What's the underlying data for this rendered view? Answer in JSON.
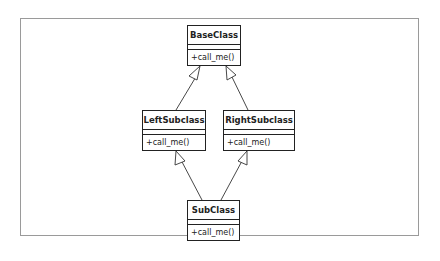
{
  "diagram": {
    "type": "uml-class-diagram",
    "classes": [
      {
        "id": "base",
        "name": "BaseClass",
        "attributes": [],
        "operations": [
          "+call_me()"
        ]
      },
      {
        "id": "left",
        "name": "LeftSubclass",
        "attributes": [],
        "operations": [
          "+call_me()"
        ]
      },
      {
        "id": "right",
        "name": "RightSubclass",
        "attributes": [],
        "operations": [
          "+call_me()"
        ]
      },
      {
        "id": "sub",
        "name": "SubClass",
        "attributes": [],
        "operations": [
          "+call_me()"
        ]
      }
    ],
    "relationships": [
      {
        "type": "generalization",
        "from": "LeftSubclass",
        "to": "BaseClass"
      },
      {
        "type": "generalization",
        "from": "RightSubclass",
        "to": "BaseClass"
      },
      {
        "type": "generalization",
        "from": "SubClass",
        "to": "LeftSubclass"
      },
      {
        "type": "generalization",
        "from": "SubClass",
        "to": "RightSubclass"
      }
    ],
    "colors": {
      "line": "#222222",
      "frame": "#9a9a9a",
      "background": "#ffffff"
    }
  }
}
